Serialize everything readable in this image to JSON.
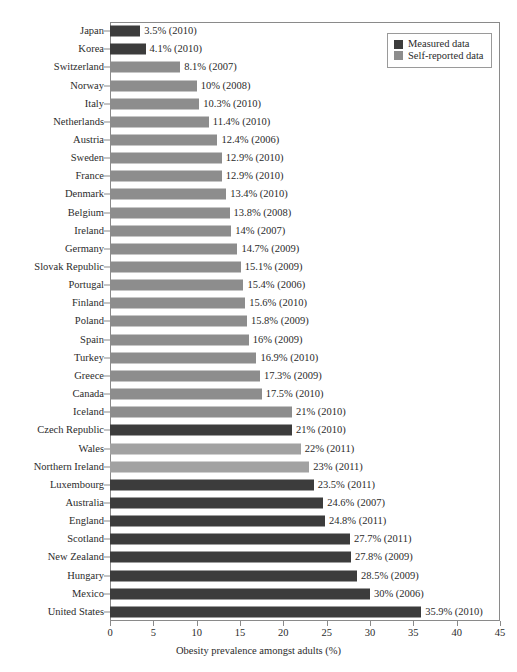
{
  "chart_data": {
    "type": "bar",
    "orientation": "horizontal",
    "title": "",
    "xlabel": "Obesity prevalence amongst adults (%)",
    "ylabel": "",
    "xlim": [
      0,
      45
    ],
    "xticks": [
      0,
      5,
      10,
      15,
      20,
      25,
      30,
      35,
      40,
      45
    ],
    "grid": false,
    "legend_position": "top-right",
    "legend": [
      {
        "name": "Measured data",
        "color": "#3c3c3c"
      },
      {
        "name": "Self-reported data",
        "color": "#8d8d8d"
      }
    ],
    "categories": [
      "Japan",
      "Korea",
      "Switzerland",
      "Norway",
      "Italy",
      "Netherlands",
      "Austria",
      "Sweden",
      "France",
      "Denmark",
      "Belgium",
      "Ireland",
      "Germany",
      "Slovak Republic",
      "Portugal",
      "Finland",
      "Poland",
      "Spain",
      "Turkey",
      "Greece",
      "Canada",
      "Iceland",
      "Czech Republic",
      "Wales",
      "Northern Ireland",
      "Luxembourg",
      "Australia",
      "England",
      "Scotland",
      "New Zealand",
      "Hungary",
      "Mexico",
      "United States"
    ],
    "values": [
      3.5,
      4.1,
      8.1,
      10,
      10.3,
      11.4,
      12.4,
      12.9,
      12.9,
      13.4,
      13.8,
      14,
      14.7,
      15.1,
      15.4,
      15.6,
      15.8,
      16,
      16.9,
      17.3,
      17.5,
      21,
      21,
      22,
      23,
      23.5,
      24.6,
      24.8,
      27.7,
      27.8,
      28.5,
      30,
      35.9
    ],
    "bars": [
      {
        "category": "Japan",
        "value": 3.5,
        "year": 2010,
        "series": "Measured data",
        "label": "3.5% (2010)"
      },
      {
        "category": "Korea",
        "value": 4.1,
        "year": 2010,
        "series": "Measured data",
        "label": "4.1% (2010)"
      },
      {
        "category": "Switzerland",
        "value": 8.1,
        "year": 2007,
        "series": "Self-reported data",
        "label": "8.1% (2007)"
      },
      {
        "category": "Norway",
        "value": 10,
        "year": 2008,
        "series": "Self-reported data",
        "label": "10% (2008)"
      },
      {
        "category": "Italy",
        "value": 10.3,
        "year": 2010,
        "series": "Self-reported data",
        "label": "10.3% (2010)"
      },
      {
        "category": "Netherlands",
        "value": 11.4,
        "year": 2010,
        "series": "Self-reported data",
        "label": "11.4% (2010)"
      },
      {
        "category": "Austria",
        "value": 12.4,
        "year": 2006,
        "series": "Self-reported data",
        "label": "12.4% (2006)"
      },
      {
        "category": "Sweden",
        "value": 12.9,
        "year": 2010,
        "series": "Self-reported data",
        "label": "12.9% (2010)"
      },
      {
        "category": "France",
        "value": 12.9,
        "year": 2010,
        "series": "Self-reported data",
        "label": "12.9% (2010)"
      },
      {
        "category": "Denmark",
        "value": 13.4,
        "year": 2010,
        "series": "Self-reported data",
        "label": "13.4% (2010)"
      },
      {
        "category": "Belgium",
        "value": 13.8,
        "year": 2008,
        "series": "Self-reported data",
        "label": "13.8% (2008)"
      },
      {
        "category": "Ireland",
        "value": 14,
        "year": 2007,
        "series": "Self-reported data",
        "label": "14% (2007)"
      },
      {
        "category": "Germany",
        "value": 14.7,
        "year": 2009,
        "series": "Self-reported data",
        "label": "14.7% (2009)"
      },
      {
        "category": "Slovak Republic",
        "value": 15.1,
        "year": 2009,
        "series": "Self-reported data",
        "label": "15.1% (2009)"
      },
      {
        "category": "Portugal",
        "value": 15.4,
        "year": 2006,
        "series": "Self-reported data",
        "label": "15.4% (2006)"
      },
      {
        "category": "Finland",
        "value": 15.6,
        "year": 2010,
        "series": "Self-reported data",
        "label": "15.6% (2010)"
      },
      {
        "category": "Poland",
        "value": 15.8,
        "year": 2009,
        "series": "Self-reported data",
        "label": "15.8% (2009)"
      },
      {
        "category": "Spain",
        "value": 16,
        "year": 2009,
        "series": "Self-reported data",
        "label": "16% (2009)"
      },
      {
        "category": "Turkey",
        "value": 16.9,
        "year": 2010,
        "series": "Self-reported data",
        "label": "16.9% (2010)"
      },
      {
        "category": "Greece",
        "value": 17.3,
        "year": 2009,
        "series": "Self-reported data",
        "label": "17.3% (2009)"
      },
      {
        "category": "Canada",
        "value": 17.5,
        "year": 2010,
        "series": "Self-reported data",
        "label": "17.5% (2010)"
      },
      {
        "category": "Iceland",
        "value": 21,
        "year": 2010,
        "series": "Self-reported data",
        "label": "21% (2010)"
      },
      {
        "category": "Czech Republic",
        "value": 21,
        "year": 2010,
        "series": "Measured data",
        "label": "21% (2010)"
      },
      {
        "category": "Wales",
        "value": 22,
        "year": 2011,
        "series": "Self-reported data",
        "label": "22% (2011)"
      },
      {
        "category": "Northern Ireland",
        "value": 23,
        "year": 2011,
        "series": "Self-reported data",
        "label": "23% (2011)"
      },
      {
        "category": "Luxembourg",
        "value": 23.5,
        "year": 2011,
        "series": "Measured data",
        "label": "23.5% (2011)"
      },
      {
        "category": "Australia",
        "value": 24.6,
        "year": 2007,
        "series": "Measured data",
        "label": "24.6% (2007)"
      },
      {
        "category": "England",
        "value": 24.8,
        "year": 2011,
        "series": "Measured data",
        "label": "24.8% (2011)"
      },
      {
        "category": "Scotland",
        "value": 27.7,
        "year": 2011,
        "series": "Measured data",
        "label": "27.7% (2011)"
      },
      {
        "category": "New Zealand",
        "value": 27.8,
        "year": 2009,
        "series": "Measured data",
        "label": "27.8% (2009)"
      },
      {
        "category": "Hungary",
        "value": 28.5,
        "year": 2009,
        "series": "Measured data",
        "label": "28.5% (2009)"
      },
      {
        "category": "Mexico",
        "value": 30,
        "year": 2006,
        "series": "Measured data",
        "label": "30% (2006)"
      },
      {
        "category": "United States",
        "value": 35.9,
        "year": 2010,
        "series": "Measured data",
        "label": "35.9% (2010)"
      }
    ]
  },
  "colors": {
    "measured": "#3c3c3c",
    "self_reported": "#8d8d8d",
    "self_reported_light": "#a2a2a2",
    "axis": "#8a8a8a",
    "text": "#2b2b2b",
    "background": "#ffffff"
  }
}
